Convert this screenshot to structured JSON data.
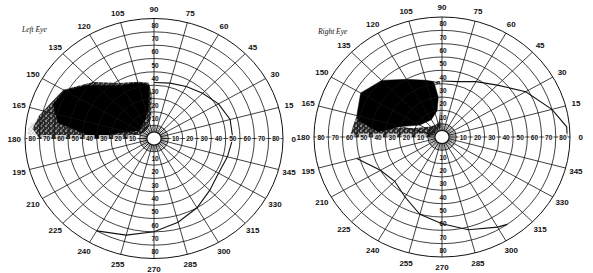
{
  "figure": {
    "type": "perimetry-visual-field-charts",
    "background": "#ffffff",
    "ink_color": "#111111"
  },
  "charts": [
    {
      "id": "left-eye",
      "title": "Left Eye",
      "center": {
        "x": 154,
        "y": 138.5
      },
      "radius": {
        "x": 129,
        "y": 120
      },
      "ring_step_deg": 10,
      "max_eccentricity_deg": 90,
      "meridian_step_deg": 15,
      "angle_labels": [
        "0",
        "15",
        "30",
        "45",
        "60",
        "75",
        "90",
        "105",
        "120",
        "135",
        "150",
        "165",
        "180",
        "195",
        "210",
        "225",
        "240",
        "255",
        "270",
        "285",
        "300",
        "315",
        "330",
        "345"
      ],
      "horizontal_ring_labels_left": [
        "80",
        "70",
        "60",
        "50",
        "40",
        "30",
        "20",
        "10"
      ],
      "horizontal_ring_labels_right": [
        "10",
        "20",
        "30",
        "40",
        "50",
        "60",
        "70",
        "80"
      ],
      "vertical_ring_labels_up": [
        "10",
        "20",
        "30",
        "40",
        "50",
        "60",
        "70",
        "80"
      ],
      "vertical_ring_labels_down": [
        "10",
        "20",
        "30",
        "40",
        "50",
        "60",
        "70",
        "80"
      ],
      "isopter": [
        [
          90,
          42
        ],
        [
          75,
          43
        ],
        [
          60,
          45
        ],
        [
          45,
          48
        ],
        [
          30,
          52
        ],
        [
          15,
          55
        ],
        [
          0,
          55
        ],
        [
          345,
          53
        ],
        [
          330,
          52
        ],
        [
          315,
          55
        ],
        [
          300,
          60
        ],
        [
          285,
          65
        ],
        [
          270,
          70
        ],
        [
          255,
          75
        ],
        [
          240,
          80
        ]
      ],
      "scotoma_absolute": [
        [
          180,
          40
        ],
        [
          170,
          68
        ],
        [
          160,
          75
        ],
        [
          150,
          72
        ],
        [
          140,
          62
        ],
        [
          130,
          52
        ],
        [
          120,
          46
        ],
        [
          110,
          44
        ],
        [
          100,
          42
        ],
        [
          95,
          40
        ],
        [
          100,
          22
        ],
        [
          120,
          14
        ],
        [
          150,
          12
        ],
        [
          170,
          25
        ],
        [
          180,
          40
        ]
      ],
      "scotoma_relative_dense": [
        [
          180,
          80
        ],
        [
          175,
          85
        ],
        [
          168,
          82
        ],
        [
          160,
          77
        ],
        [
          150,
          73
        ],
        [
          135,
          60
        ],
        [
          120,
          48
        ],
        [
          105,
          44
        ],
        [
          95,
          42
        ],
        [
          92,
          32
        ],
        [
          95,
          18
        ],
        [
          110,
          10
        ],
        [
          130,
          8
        ],
        [
          155,
          9
        ],
        [
          170,
          13
        ],
        [
          180,
          16
        ]
      ],
      "scotoma_relative_light": [
        [
          180,
          88
        ],
        [
          175,
          88
        ],
        [
          172,
          86
        ],
        [
          170,
          70
        ],
        [
          175,
          40
        ],
        [
          178,
          20
        ],
        [
          180,
          10
        ]
      ],
      "light_column": [
        [
          90,
          40
        ],
        [
          92,
          40
        ],
        [
          96,
          18
        ],
        [
          90,
          8
        ]
      ]
    },
    {
      "id": "right-eye",
      "title": "Right Eye",
      "center": {
        "x": 442,
        "y": 137
      },
      "radius": {
        "x": 128,
        "y": 120
      },
      "ring_step_deg": 10,
      "max_eccentricity_deg": 90,
      "meridian_step_deg": 15,
      "angle_labels": [
        "0",
        "15",
        "30",
        "45",
        "60",
        "75",
        "90",
        "105",
        "120",
        "135",
        "150",
        "165",
        "180",
        "195",
        "210",
        "225",
        "240",
        "255",
        "270",
        "285",
        "300",
        "315",
        "330",
        "345"
      ],
      "horizontal_ring_labels_left": [
        "80",
        "70",
        "60",
        "50",
        "40",
        "30",
        "20",
        "10"
      ],
      "horizontal_ring_labels_right": [
        "10",
        "20",
        "30",
        "40",
        "50",
        "60",
        "70",
        "80"
      ],
      "vertical_ring_labels_up": [
        "10",
        "20",
        "30",
        "40",
        "50",
        "60",
        "70",
        "80"
      ],
      "vertical_ring_labels_down": [
        "10",
        "20",
        "30",
        "40",
        "50",
        "60",
        "70",
        "80"
      ],
      "isopter": [
        [
          90,
          42
        ],
        [
          75,
          43
        ],
        [
          60,
          48
        ],
        [
          45,
          55
        ],
        [
          30,
          68
        ],
        [
          15,
          80
        ],
        [
          5,
          88
        ],
        [
          0,
          88
        ]
      ],
      "isopter_lower": [
        [
          195,
          62
        ],
        [
          210,
          50
        ],
        [
          225,
          47
        ],
        [
          240,
          52
        ],
        [
          255,
          60
        ],
        [
          270,
          65
        ],
        [
          285,
          72
        ],
        [
          300,
          78
        ],
        [
          305,
          80
        ]
      ],
      "scotoma_absolute": [
        [
          165,
          62
        ],
        [
          150,
          66
        ],
        [
          135,
          60
        ],
        [
          120,
          50
        ],
        [
          105,
          44
        ],
        [
          98,
          42
        ],
        [
          95,
          30
        ],
        [
          100,
          20
        ],
        [
          120,
          15
        ],
        [
          150,
          18
        ],
        [
          165,
          30
        ],
        [
          175,
          45
        ],
        [
          168,
          60
        ]
      ],
      "scotoma_relative_dense": [
        [
          180,
          65
        ],
        [
          172,
          63
        ],
        [
          165,
          62
        ],
        [
          170,
          40
        ],
        [
          160,
          20
        ],
        [
          140,
          12
        ],
        [
          115,
          10
        ],
        [
          100,
          12
        ],
        [
          95,
          18
        ],
        [
          92,
          42
        ],
        [
          98,
          42
        ],
        [
          95,
          40
        ],
        [
          90,
          40
        ],
        [
          90,
          8
        ],
        [
          120,
          6
        ],
        [
          160,
          6
        ],
        [
          180,
          8
        ]
      ],
      "light_column": [
        [
          90,
          42
        ],
        [
          92,
          42
        ],
        [
          96,
          10
        ],
        [
          90,
          6
        ]
      ]
    }
  ],
  "labels": {
    "left_title": "Left Eye",
    "right_title": "Right Eye"
  }
}
